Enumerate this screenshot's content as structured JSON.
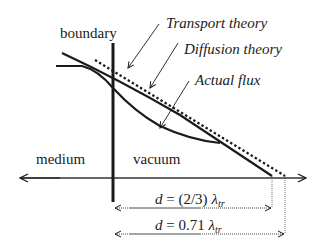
{
  "labels": {
    "boundary": "boundary",
    "medium": "medium",
    "vacuum": "vacuum",
    "transport_theory": "Transport theory",
    "diffusion_theory": "Diffusion theory",
    "actual_flux": "Actual flux"
  },
  "dimensions": {
    "d1": {
      "prefix": "d",
      "equals": " = (2/3) ",
      "symbol": "λ",
      "subscript": "tr"
    },
    "d2": {
      "prefix": "d",
      "equals": " = 0.71 ",
      "symbol": "λ",
      "subscript": "tr"
    }
  },
  "colors": {
    "ink": "#1a1a1a",
    "background": "#ffffff"
  }
}
